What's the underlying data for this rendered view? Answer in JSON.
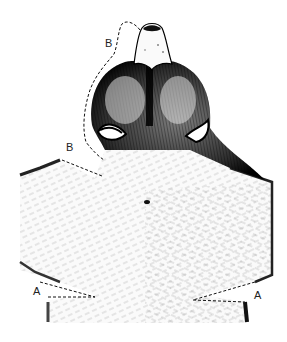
{
  "figure": {
    "colors": {
      "ink": "#111111",
      "fur_light": "#e8e8e8",
      "background": "#ffffff"
    }
  },
  "labels": {
    "b_upper": "B",
    "b_lower": "B",
    "a_left": "A",
    "a_right": "A"
  }
}
